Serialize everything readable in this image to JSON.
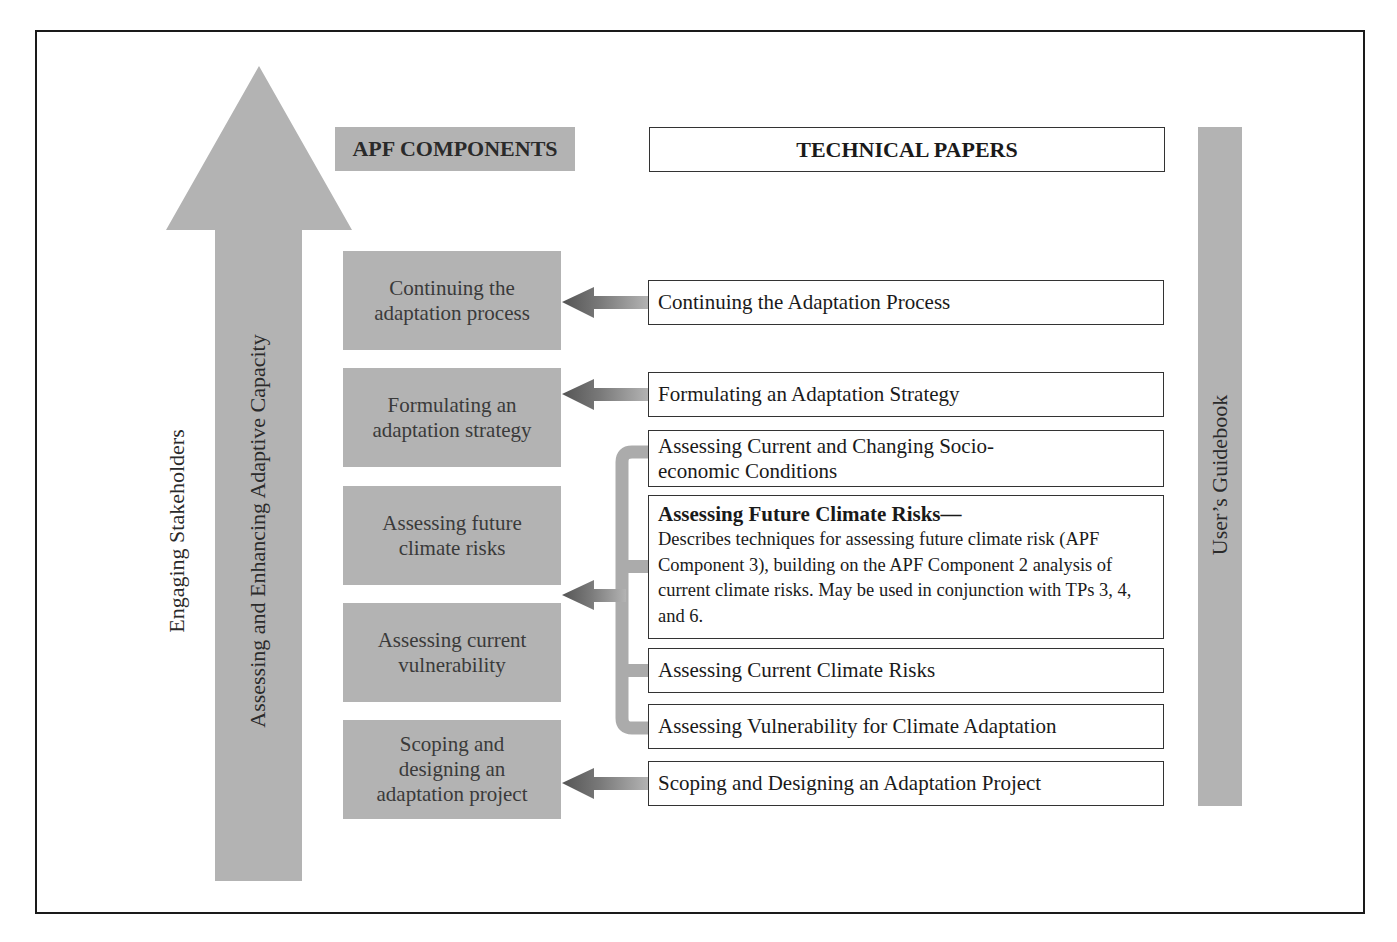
{
  "diagram": {
    "vertical_labels": {
      "engaging": "Engaging Stakeholders",
      "capacity": "Assessing and Enhancing Adaptive Capacity",
      "guidebook": "User’s Guidebook"
    },
    "headers": {
      "components": "APF COMPONENTS",
      "technical_papers": "TECHNICAL PAPERS"
    },
    "components": [
      {
        "label": "Continuing the adaptation process"
      },
      {
        "label": "Formulating an adaptation strategy"
      },
      {
        "label": "Assessing future climate risks"
      },
      {
        "label": "Assessing current vulnerability"
      },
      {
        "label": "Scoping and designing an adaptation project"
      }
    ],
    "technical_papers": [
      {
        "title": "Continuing the Adaptation Process"
      },
      {
        "title": "Formulating an Adaptation Strategy"
      },
      {
        "title": "Assessing Current and Changing Socio-economic Conditions"
      },
      {
        "title": "Assessing Future Climate Risks—",
        "description": "Describes techniques for assessing future climate risk (APF Component 3), building on the APF Component 2 analysis of current climate risks. May be used in conjunction with TPs 3, 4, and 6."
      },
      {
        "title": "Assessing Current Climate Risks"
      },
      {
        "title": "Assessing Vulnerability for Climate Adaptation"
      },
      {
        "title": "Scoping and Designing an Adaptation Project"
      }
    ],
    "colors": {
      "gray_fill": "#b3b3b3",
      "arrow_dark": "#5a5a5a",
      "border": "#1a1a1a"
    }
  }
}
